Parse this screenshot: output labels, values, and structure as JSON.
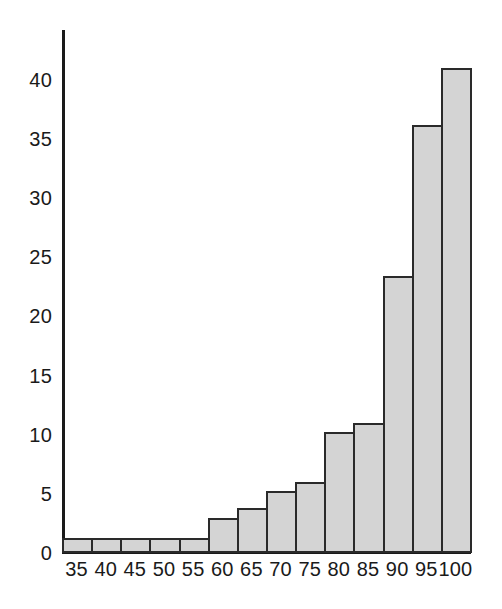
{
  "chart_data": {
    "type": "bar",
    "title": "",
    "subtitle": "",
    "xlabel": "",
    "ylabel": "",
    "categories": [
      "35",
      "40",
      "45",
      "50",
      "55",
      "60",
      "65",
      "70",
      "75",
      "80",
      "85",
      "90",
      "95",
      "100"
    ],
    "values": [
      1.3,
      1.3,
      1.3,
      1.3,
      1.3,
      3.0,
      3.8,
      5.2,
      6.0,
      10.2,
      11.0,
      23.4,
      36.2,
      41.0
    ],
    "xtick_labels": [
      "35",
      "40",
      "45",
      "50",
      "55",
      "60",
      "65",
      "70",
      "75",
      "80",
      "85",
      "90",
      "95",
      "100"
    ],
    "ytick_labels": [
      "0",
      "5",
      "10",
      "15",
      "20",
      "25",
      "30",
      "35",
      "40"
    ],
    "ytick_values": [
      0,
      5,
      10,
      15,
      20,
      25,
      30,
      35,
      40
    ],
    "ylim": [
      0,
      44.2
    ],
    "xlim": [
      32.5,
      102.5
    ],
    "grid": false,
    "legend": null,
    "legend_position": "none",
    "annotations": [],
    "bar_fill_color": "#d4d4d4",
    "bar_edge_color": "#2a2a2a",
    "axis_color": "#1a1a1a",
    "background_color": "#ffffff"
  }
}
